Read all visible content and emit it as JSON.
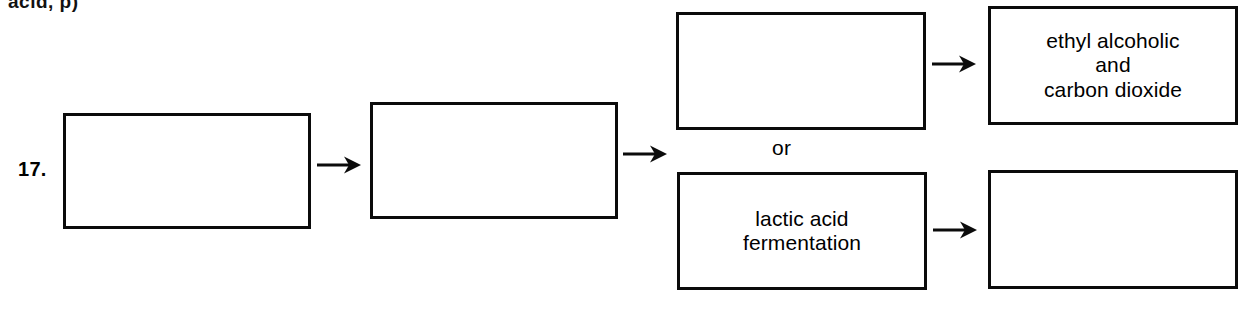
{
  "page": {
    "width": 1254,
    "height": 324,
    "background_color": "#ffffff",
    "ink_color": "#000000",
    "cut_off_text_above": "acid, p)"
  },
  "item": {
    "number_label": "17."
  },
  "diagram": {
    "type": "flowchart",
    "connector_label": "or",
    "boxes": [
      {
        "id": "box-1",
        "text": "",
        "filled": false,
        "position": "left-start"
      },
      {
        "id": "box-2",
        "text": "",
        "filled": false,
        "position": "second-stage"
      },
      {
        "id": "box-3",
        "text": "",
        "filled": false,
        "position": "upper-branch-process"
      },
      {
        "id": "box-4",
        "text": "ethyl alcoholic\nand\ncarbon dioxide",
        "filled": true,
        "position": "upper-branch-product"
      },
      {
        "id": "box-5",
        "text": "lactic acid\nfermentation",
        "filled": true,
        "position": "lower-branch-process"
      },
      {
        "id": "box-6",
        "text": "",
        "filled": false,
        "position": "lower-branch-product"
      }
    ],
    "arrows": [
      {
        "id": "arrow-1",
        "from": "box-1",
        "to": "box-2",
        "direction": "right"
      },
      {
        "id": "arrow-2",
        "from": "box-2",
        "to": "branch",
        "direction": "right"
      },
      {
        "id": "arrow-3",
        "from": "box-3",
        "to": "box-4",
        "direction": "right"
      },
      {
        "id": "arrow-4",
        "from": "box-5",
        "to": "box-6",
        "direction": "right"
      }
    ]
  }
}
